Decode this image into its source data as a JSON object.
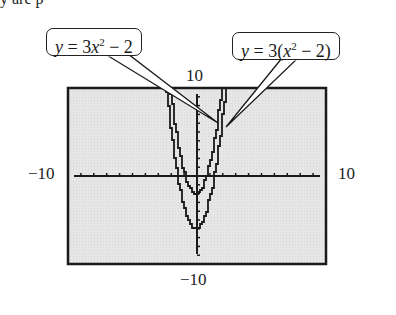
{
  "top_text": "y are  p",
  "callouts": [
    {
      "id": "inner",
      "label_var": "y",
      "label_eq": " = 3",
      "label_x": "x",
      "label_exp": "2",
      "label_tail": " − 2",
      "full": "y = 3x² − 2"
    },
    {
      "id": "outer",
      "label_var": "y",
      "label_eq": " = 3(",
      "label_x": "x",
      "label_exp": "2",
      "label_tail": " − 2)",
      "full": "y = 3(x² − 2)"
    }
  ],
  "axis_labels": {
    "ymax": "10",
    "ymin": "−10",
    "xmin": "−10",
    "xmax": "10"
  },
  "colors": {
    "screen_bg": "#e4e4e4",
    "frame": "#1a1a1a",
    "curve": "#1a1a1a"
  },
  "chart_data": {
    "type": "line",
    "title": "",
    "xlabel": "",
    "ylabel": "",
    "xlim": [
      -10,
      10
    ],
    "ylim": [
      -10,
      10
    ],
    "grid": false,
    "x_ticks_step": 1,
    "y_ticks_step": 1,
    "series": [
      {
        "name": "y = 3x² − 2",
        "equation": "3*x^2 - 2",
        "vertex": [
          0,
          -2
        ],
        "x": [
          -2.31,
          -2,
          -1.5,
          -1,
          -0.5,
          0,
          0.5,
          1,
          1.5,
          2,
          2.31
        ],
        "y": [
          14,
          10,
          4.75,
          1,
          -1.25,
          -2,
          -1.25,
          1,
          4.75,
          10,
          14
        ]
      },
      {
        "name": "y = 3(x² − 2)",
        "equation": "3*(x^2 - 2)",
        "vertex": [
          0,
          -6
        ],
        "x": [
          -2.58,
          -2.5,
          -2,
          -1.5,
          -1,
          -0.5,
          0,
          0.5,
          1,
          1.5,
          2,
          2.5,
          2.58
        ],
        "y": [
          14,
          12.75,
          6,
          0.75,
          -3,
          -5.25,
          -6,
          -5.25,
          -3,
          0.75,
          6,
          12.75,
          14
        ]
      }
    ],
    "window": {
      "Xmin": -10,
      "Xmax": 10,
      "Ymin": -10,
      "Ymax": 10
    }
  }
}
